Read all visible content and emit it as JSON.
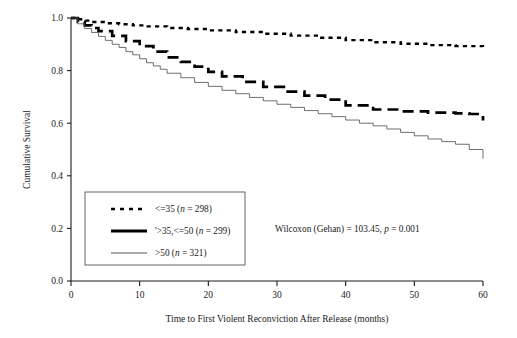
{
  "chart_data": {
    "type": "line",
    "subtype": "kaplan-meier-survival",
    "title": "",
    "xlabel": "Time to First Violent Reconviction After Release (months)",
    "ylabel": "Cumulative Survival",
    "xlim": [
      0,
      60
    ],
    "ylim": [
      0.0,
      1.0
    ],
    "xticks": [
      0,
      10,
      20,
      30,
      40,
      50,
      60
    ],
    "xticklabels": [
      "0",
      "10",
      "20",
      "30",
      "40",
      "50",
      "60"
    ],
    "yticks": [
      0.0,
      0.2,
      0.4,
      0.6,
      0.8,
      1.0
    ],
    "yticklabels": [
      "0.0",
      "0.2",
      "0.4",
      "0.6",
      "0.8",
      "1.0"
    ],
    "grid": false,
    "legend_position": "lower-left",
    "annotation": "Wilcoxon (Gehan) = 103.45, p = 0.001",
    "series": [
      {
        "name": "<=35 (n = 298)",
        "group_label": "<=35",
        "n": 298,
        "style": "dotted",
        "color": "#000000",
        "x": [
          0,
          1,
          2,
          3,
          5,
          7,
          9,
          11,
          14,
          17,
          20,
          24,
          28,
          32,
          36,
          40,
          44,
          48,
          52,
          56,
          60
        ],
        "y": [
          1.0,
          0.995,
          0.99,
          0.985,
          0.98,
          0.976,
          0.972,
          0.968,
          0.962,
          0.958,
          0.953,
          0.947,
          0.94,
          0.933,
          0.925,
          0.916,
          0.908,
          0.902,
          0.897,
          0.893,
          0.89
        ]
      },
      {
        "name": ">35,<=50 (n = 299)",
        "group_label": ">35,<=50",
        "n": 299,
        "style": "dashed",
        "color": "#000000",
        "x": [
          0,
          1,
          2,
          3,
          4,
          6,
          8,
          10,
          12,
          14,
          16,
          18,
          20,
          22,
          25,
          28,
          31,
          34,
          37,
          40,
          44,
          48,
          52,
          56,
          58,
          60
        ],
        "y": [
          1.0,
          0.985,
          0.972,
          0.962,
          0.95,
          0.932,
          0.912,
          0.893,
          0.872,
          0.85,
          0.833,
          0.815,
          0.795,
          0.778,
          0.757,
          0.738,
          0.72,
          0.705,
          0.69,
          0.668,
          0.652,
          0.645,
          0.64,
          0.637,
          0.635,
          0.61
        ]
      },
      {
        "name": ">50 (n = 321)",
        "group_label": ">50",
        "n": 321,
        "style": "solid",
        "color": "#555555",
        "x": [
          0,
          1,
          2,
          3,
          4,
          5,
          6,
          7,
          8,
          9,
          10,
          11,
          12,
          13,
          14,
          16,
          18,
          20,
          22,
          24,
          26,
          28,
          30,
          32,
          34,
          36,
          38,
          40,
          42,
          44,
          46,
          48,
          50,
          52,
          54,
          56,
          58,
          60
        ],
        "y": [
          1.0,
          0.978,
          0.96,
          0.945,
          0.93,
          0.915,
          0.9,
          0.888,
          0.872,
          0.86,
          0.845,
          0.83,
          0.818,
          0.805,
          0.79,
          0.773,
          0.755,
          0.74,
          0.725,
          0.712,
          0.698,
          0.685,
          0.672,
          0.66,
          0.648,
          0.636,
          0.625,
          0.612,
          0.6,
          0.59,
          0.578,
          0.565,
          0.552,
          0.54,
          0.53,
          0.52,
          0.5,
          0.465
        ]
      }
    ]
  },
  "legend": {
    "entries": [
      {
        "label": "<=35 (n = 298)",
        "prefix": "<=35 (",
        "italic": "n",
        "suffix": " = 298)",
        "style": "dotted"
      },
      {
        "label": ">35,<=50 (n = 299)",
        "prefix": "'>35,<=50 (",
        "italic": "n",
        "suffix": " = 299)",
        "style": "dashed"
      },
      {
        "label": ">50 (n = 321)",
        "prefix": ">50 (",
        "italic": "n",
        "suffix": " = 321)",
        "style": "solid"
      }
    ]
  },
  "annotation": {
    "prefix": "Wilcoxon (Gehan) = 103.45, ",
    "italic": "p",
    "suffix": " = 0.001"
  }
}
